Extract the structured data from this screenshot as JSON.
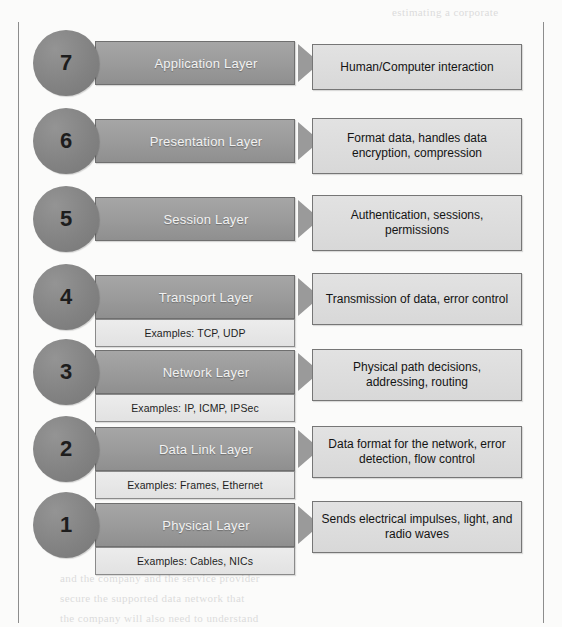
{
  "diagram": {
    "colors": {
      "circle": "#878787",
      "layer_bar": "#9a9a9a",
      "layer_bar_text": "#f2f2f2",
      "examples_box": "#e7e7e7",
      "description_box": "#dcdcdc",
      "border": "#767676",
      "frame_rule": "#8d8d8d",
      "page_background": "#fbfbfa"
    },
    "layers": [
      {
        "number": "7",
        "name": "Application Layer",
        "examples": null,
        "description": "Human/Computer interaction"
      },
      {
        "number": "6",
        "name": "Presentation Layer",
        "examples": null,
        "description": "Format data, handles data encryption, compression"
      },
      {
        "number": "5",
        "name": "Session Layer",
        "examples": null,
        "description": "Authentication, sessions, permissions"
      },
      {
        "number": "4",
        "name": "Transport Layer",
        "examples": "Examples: TCP, UDP",
        "description": "Transmission of data, error control"
      },
      {
        "number": "3",
        "name": "Network Layer",
        "examples": "Examples: IP, ICMP, IPSec",
        "description": "Physical path decisions, addressing, routing"
      },
      {
        "number": "2",
        "name": "Data Link Layer",
        "examples": "Examples: Frames, Ethernet",
        "description": "Data format for the network, error detection, flow control"
      },
      {
        "number": "1",
        "name": "Physical Layer",
        "examples": "Examples: Cables, NICs",
        "description": "Sends electrical impulses, light, and radio waves"
      }
    ]
  }
}
